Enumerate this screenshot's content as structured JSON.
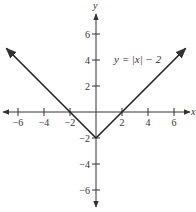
{
  "chart_data": {
    "type": "line",
    "title": "",
    "equation_label": "y = |x| − 2",
    "xlabel": "x",
    "ylabel": "y",
    "xlim": [
      -7,
      7
    ],
    "ylim": [
      -7,
      7
    ],
    "x_ticks": [
      -6,
      -4,
      -2,
      2,
      4,
      6
    ],
    "y_ticks": [
      6,
      4,
      2,
      -2,
      -4,
      -6
    ],
    "x_tick_labels": [
      "−6",
      "−4",
      "−2",
      "2",
      "4",
      "6"
    ],
    "y_tick_labels": [
      "6",
      "4",
      "2",
      "−2",
      "−4",
      "−6"
    ],
    "grid": false,
    "series": [
      {
        "name": "y = |x| − 2",
        "x": [
          -6.9,
          0,
          6.9
        ],
        "y": [
          4.9,
          -2,
          4.9
        ]
      }
    ],
    "annotations": [
      {
        "text": "y = |x| − 2",
        "x": 2.3,
        "y": 4
      }
    ]
  }
}
